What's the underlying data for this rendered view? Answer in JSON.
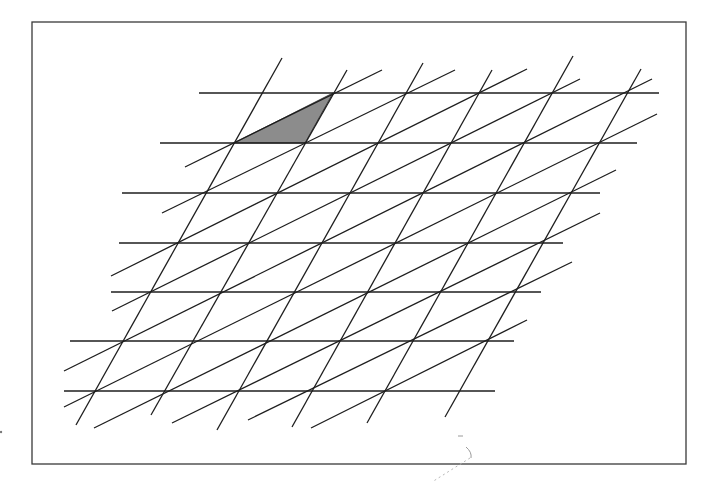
{
  "figure": {
    "frame": {
      "x": 32,
      "y": 22,
      "width": 654,
      "height": 442
    },
    "shaded_triangle": {
      "points": [
        [
          234,
          143
        ],
        [
          333,
          93
        ],
        [
          305,
          143
        ]
      ],
      "fill": "#8c8c8c"
    },
    "lattice": {
      "origin": [
        333,
        93
      ],
      "horizontal_step": [
        73.5,
        0
      ],
      "row_step": [
        -28.5,
        49.7
      ],
      "rows": 7
    },
    "horizontal_lines": [
      {
        "y": 93,
        "x1": 199,
        "x2": 659
      },
      {
        "y": 143,
        "x1": 160,
        "x2": 637
      },
      {
        "y": 193,
        "x1": 122,
        "x2": 600
      },
      {
        "y": 243,
        "x1": 119,
        "x2": 563
      },
      {
        "y": 292,
        "x1": 111,
        "x2": 541
      },
      {
        "y": 341,
        "x1": 70,
        "x2": 514
      },
      {
        "y": 391,
        "x1": 64,
        "x2": 495
      }
    ],
    "steep_lines": [
      {
        "x1": 282,
        "y1": 58,
        "x2": 76,
        "y2": 425
      },
      {
        "x1": 347,
        "y1": 70,
        "x2": 151,
        "y2": 415
      },
      {
        "x1": 423,
        "y1": 63,
        "x2": 217,
        "y2": 430
      },
      {
        "x1": 492,
        "y1": 70,
        "x2": 292,
        "y2": 427
      },
      {
        "x1": 573,
        "y1": 56,
        "x2": 367,
        "y2": 423
      },
      {
        "x1": 641,
        "y1": 69,
        "x2": 445,
        "y2": 417
      }
    ],
    "shallow_lines": [
      {
        "x1": 185,
        "y1": 167,
        "x2": 382,
        "y2": 70
      },
      {
        "x1": 162,
        "y1": 213,
        "x2": 455,
        "y2": 70
      },
      {
        "x1": 111,
        "y1": 276,
        "x2": 527,
        "y2": 69
      },
      {
        "x1": 112,
        "y1": 311,
        "x2": 580,
        "y2": 79
      },
      {
        "x1": 64,
        "y1": 371,
        "x2": 652,
        "y2": 79
      },
      {
        "x1": 64,
        "y1": 407,
        "x2": 657,
        "y2": 114
      },
      {
        "x1": 94,
        "y1": 428,
        "x2": 616,
        "y2": 170
      },
      {
        "x1": 172,
        "y1": 423,
        "x2": 600,
        "y2": 213
      },
      {
        "x1": 248,
        "y1": 420,
        "x2": 572,
        "y2": 262
      },
      {
        "x1": 311,
        "y1": 428,
        "x2": 527,
        "y2": 320
      }
    ],
    "scan_artifacts": {
      "curve": "M466 447 Q472 452 471 458",
      "dotted": "M470 458 L432 482",
      "dash": "M458 436 L463 436",
      "speck": {
        "x": 1,
        "y": 432
      }
    },
    "colors": {
      "line": "#1e1e1e",
      "frame": "#3a3a3a",
      "shade": "#8c8c8c",
      "background": "#ffffff"
    }
  }
}
